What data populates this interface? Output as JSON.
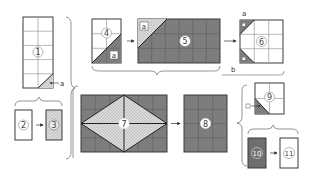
{
  "diagram": {
    "type": "quilt-piecing-steps",
    "colors": {
      "outline": "#3a3a3a",
      "grid_line": "#8a8a8a",
      "dark_fabric": "#7d7d7d",
      "light_fabric": "#ffffff",
      "dotted_fabric": "#d4d4d4",
      "brace": "#666666"
    },
    "labels": {
      "a": "a",
      "b": "b"
    },
    "pieces": [
      {
        "id": "1",
        "label": "1",
        "fill": "white",
        "grid": "2x5",
        "note": "diagonal corner marked a"
      },
      {
        "id": "2",
        "label": "2",
        "fill": "white"
      },
      {
        "id": "3",
        "label": "3",
        "fill": "dotted"
      },
      {
        "id": "4",
        "label": "4",
        "fill": "white",
        "grid": "2x3",
        "corner": "a",
        "corner_fill": "dark"
      },
      {
        "id": "5",
        "label": "5",
        "fill": "dark",
        "grid": "6x3",
        "corner": "a",
        "corner_fill": "dotted"
      },
      {
        "id": "6",
        "label": "6",
        "fill": "white",
        "grid": "3x3",
        "corners": [
          "a",
          "b"
        ],
        "corner_fill": "dark"
      },
      {
        "id": "7",
        "label": "7",
        "fill": "dark",
        "grid": "6x4",
        "center": "dotted diamond"
      },
      {
        "id": "8",
        "label": "8",
        "fill": "dark",
        "grid": "3x4"
      },
      {
        "id": "9",
        "label": "9",
        "fill": "white",
        "grid": "2x2",
        "corner": "a",
        "corner_fill": "dark"
      },
      {
        "id": "10",
        "label": "10",
        "fill": "dark"
      },
      {
        "id": "11",
        "label": "11",
        "fill": "white"
      }
    ],
    "arrows": [
      {
        "from": "2",
        "to": "3"
      },
      {
        "from": "4",
        "to": "5"
      },
      {
        "from": "5",
        "to": "6"
      },
      {
        "from": "7",
        "to": "8"
      },
      {
        "from": "10",
        "to": "11"
      },
      {
        "from": "a",
        "to": "1"
      },
      {
        "from": "a",
        "to": "9"
      }
    ]
  }
}
